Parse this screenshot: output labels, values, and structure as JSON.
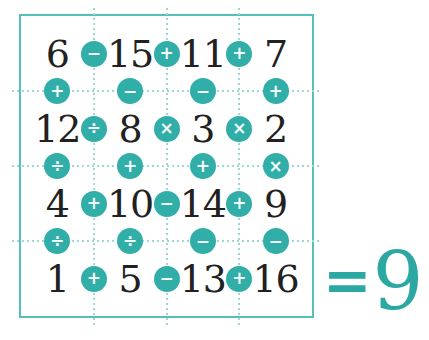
{
  "palette": {
    "bg": "#ffffff",
    "border": "#54c0b9",
    "dots": "#9ed7d3",
    "circle": "#30aea7",
    "glyph": "#f3fbfa",
    "ink": "#212121",
    "result": "#2ba8a1"
  },
  "puzzle": {
    "numbers": [
      [
        "6",
        "15",
        "11",
        "7"
      ],
      [
        "12",
        "8",
        "3",
        "2"
      ],
      [
        "4",
        "10",
        "14",
        "9"
      ],
      [
        "1",
        "5",
        "13",
        "16"
      ]
    ],
    "row_operators": [
      [
        "−",
        "+",
        "+"
      ],
      [
        "÷",
        "×",
        "×"
      ],
      [
        "+",
        "−",
        "+"
      ],
      [
        "+",
        "−",
        "+"
      ]
    ],
    "column_operators": [
      [
        "+",
        "−",
        "−",
        "+"
      ],
      [
        "÷",
        "+",
        "+",
        "×"
      ],
      [
        "÷",
        "÷",
        "−",
        "−"
      ]
    ],
    "result": {
      "equals_sign": "=",
      "value": "9"
    }
  }
}
